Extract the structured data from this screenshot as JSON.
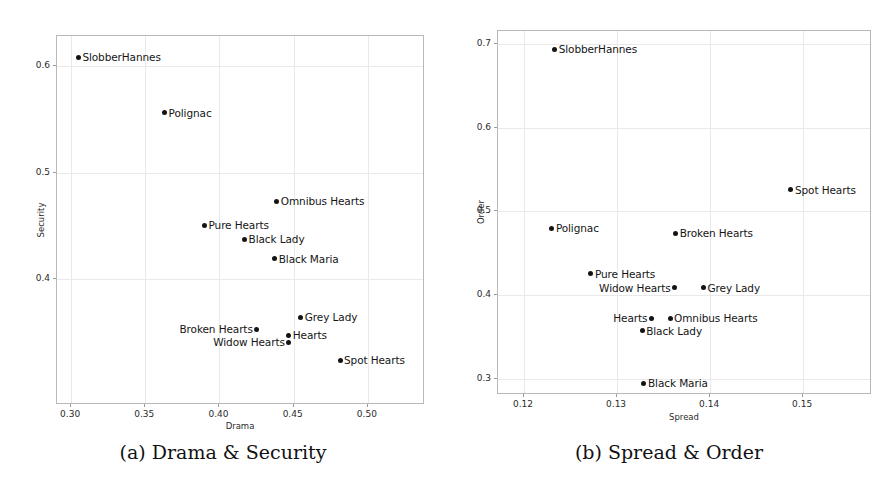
{
  "figure": {
    "background": "#ffffff",
    "point_color": "#141414",
    "grid_color": "#e9e9e9",
    "frame_color": "#b9b9b9"
  },
  "panels": [
    {
      "id": "a",
      "caption": "(a) Drama & Security",
      "chart_data": {
        "type": "scatter",
        "title": "",
        "xlabel": "Drama",
        "ylabel": "Security",
        "xlim": [
          0.2905,
          0.5385
        ],
        "ylim": [
          0.2817,
          0.6283
        ],
        "xticks": [
          0.3,
          0.35,
          0.4,
          0.45,
          0.5
        ],
        "xticklabels": [
          "0.30",
          "0.35",
          "0.40",
          "0.45",
          "0.50"
        ],
        "yticks": [
          0.4,
          0.5,
          0.6
        ],
        "yticklabels": [
          "0.4",
          "0.5",
          "0.6"
        ],
        "grid": true,
        "legend": "none",
        "points": [
          {
            "label": "SlobberHannes",
            "x": 0.3056,
            "y": 0.6074,
            "label_side": "right"
          },
          {
            "label": "Polignac",
            "x": 0.3637,
            "y": 0.5551,
            "label_side": "right"
          },
          {
            "label": "Omnibus Hearts",
            "x": 0.4393,
            "y": 0.472,
            "label_side": "right"
          },
          {
            "label": "Pure Hearts",
            "x": 0.3906,
            "y": 0.4495,
            "label_side": "right"
          },
          {
            "label": "Black Lady",
            "x": 0.4176,
            "y": 0.4364,
            "label_side": "right"
          },
          {
            "label": "Black Maria",
            "x": 0.4379,
            "y": 0.4181,
            "label_side": "right"
          },
          {
            "label": "Grey Lady",
            "x": 0.4555,
            "y": 0.3631,
            "label_side": "right"
          },
          {
            "label": "Broken Hearts",
            "x": 0.4258,
            "y": 0.3519,
            "label_side": "left"
          },
          {
            "label": "Hearts",
            "x": 0.4474,
            "y": 0.3462,
            "label_side": "right"
          },
          {
            "label": "Widow Hearts",
            "x": 0.4474,
            "y": 0.3397,
            "label_side": "left"
          },
          {
            "label": "Spot Hearts",
            "x": 0.4819,
            "y": 0.3229,
            "label_side": "right"
          }
        ]
      }
    },
    {
      "id": "b",
      "caption": "(b) Spread & Order",
      "chart_data": {
        "type": "scatter",
        "title": "",
        "xlabel": "Spread",
        "ylabel": "Order",
        "xlim": [
          0.1172,
          0.1574
        ],
        "ylim": [
          0.2808,
          0.7152
        ],
        "xticks": [
          0.12,
          0.13,
          0.14,
          0.15
        ],
        "xticklabels": [
          "0.12",
          "0.13",
          "0.14",
          "0.15"
        ],
        "yticks": [
          0.3,
          0.4,
          0.5,
          0.6,
          0.7
        ],
        "yticklabels": [
          "0.3",
          "0.4",
          "0.5",
          "0.6",
          "0.7"
        ],
        "grid": true,
        "legend": "none",
        "points": [
          {
            "label": "SlobberHannes",
            "x": 0.1234,
            "y": 0.6924,
            "label_side": "right"
          },
          {
            "label": "Spot Hearts",
            "x": 0.1488,
            "y": 0.5243,
            "label_side": "right"
          },
          {
            "label": "Polignac",
            "x": 0.1231,
            "y": 0.4788,
            "label_side": "right"
          },
          {
            "label": "Broken Hearts",
            "x": 0.1364,
            "y": 0.4727,
            "label_side": "right"
          },
          {
            "label": "Pure Hearts",
            "x": 0.1273,
            "y": 0.4242,
            "label_side": "right"
          },
          {
            "label": "Widow Hearts",
            "x": 0.1363,
            "y": 0.4076,
            "label_side": "left"
          },
          {
            "label": "Grey Lady",
            "x": 0.1394,
            "y": 0.4076,
            "label_side": "right"
          },
          {
            "label": "Hearts",
            "x": 0.1338,
            "y": 0.3712,
            "label_side": "left"
          },
          {
            "label": "Omnibus Hearts",
            "x": 0.1358,
            "y": 0.3712,
            "label_side": "right"
          },
          {
            "label": "Black Lady",
            "x": 0.1328,
            "y": 0.3561,
            "label_side": "right"
          },
          {
            "label": "Black Maria",
            "x": 0.133,
            "y": 0.2939,
            "label_side": "right"
          }
        ]
      }
    }
  ]
}
